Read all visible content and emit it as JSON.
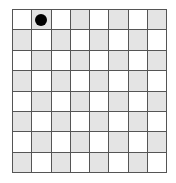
{
  "board": {
    "rows": 8,
    "cols": 8,
    "colors": {
      "light": "#ffffff",
      "dark": "#e4e4e4",
      "grid_line": "#555555",
      "piece": "#000000"
    },
    "pieces": [
      {
        "row": 0,
        "col": 1,
        "type": "black-stone"
      }
    ]
  }
}
